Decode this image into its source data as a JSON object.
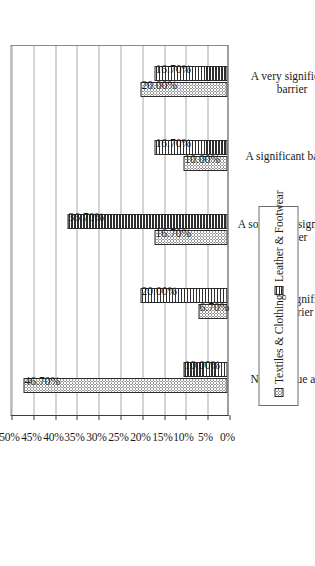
{
  "chart_data": {
    "type": "bar",
    "title": "",
    "subtitle": "",
    "xlabel": "",
    "ylabel": "",
    "orientation": "vertical-bars-rotated-90",
    "grid": true,
    "legend_position": "bottom",
    "ylim": [
      0,
      50
    ],
    "ytick_step": 5,
    "categories": [
      "Not an issue at all",
      "Not a significant barrier",
      "A somewhat significant\nbarrier",
      "A significant barrier",
      "A very significant\nbarrier"
    ],
    "tick_labels": [
      "0%",
      "5%",
      "10%",
      "15%",
      "20%",
      "25%",
      "30%",
      "35%",
      "40%",
      "45%",
      "50%"
    ],
    "tick_values": [
      0,
      5,
      10,
      15,
      20,
      25,
      30,
      35,
      40,
      45,
      50
    ],
    "series": [
      {
        "name": "Textiles & Clothing",
        "pattern": "dots",
        "values": [
          46.7,
          6.7,
          16.7,
          10.0,
          20.0
        ],
        "data_labels": [
          "46.70%",
          "6.70%",
          "16.70%",
          "10.00%",
          "20.00%"
        ]
      },
      {
        "name": "Leather & Footwear",
        "pattern": "horizontal-stripes",
        "values": [
          10.0,
          20.0,
          36.7,
          16.7,
          16.7
        ],
        "data_labels": [
          "10.00%",
          "20.00%",
          "36.70%",
          "16.70%",
          "16.70%"
        ]
      }
    ]
  },
  "colors": {
    "background": "#ffffff",
    "axis": "#3c3c3c",
    "gridline": "#a9a9a9",
    "bar_outline": "#2b2b2b",
    "pattern_ink": "#2e2e2e",
    "legend_border": "#6e6e6e",
    "text": "#1a1a1a"
  },
  "legend": {
    "entries": [
      {
        "label": "Textiles & Clothing",
        "marker": "dots-swatch-icon"
      },
      {
        "label": "Leather & Footwear",
        "marker": "stripes-swatch-icon"
      }
    ]
  }
}
